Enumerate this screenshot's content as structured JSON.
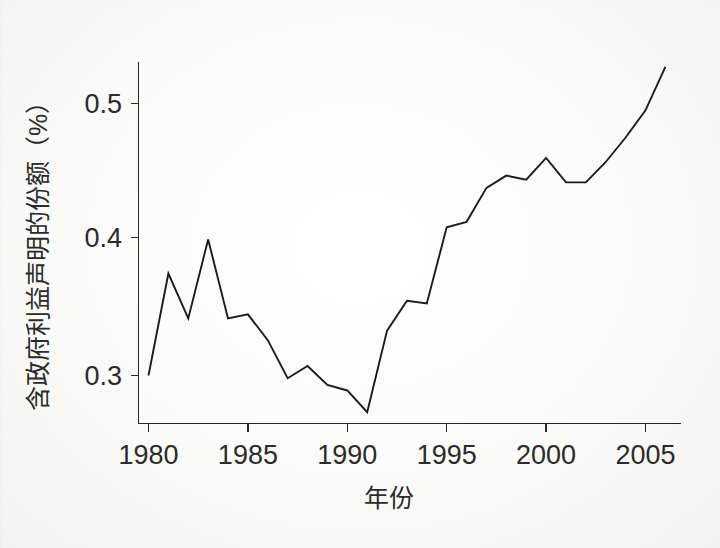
{
  "chart_data": {
    "type": "line",
    "title": "",
    "subtitle": "",
    "xlabel": "年份",
    "ylabel": "含政府利益声明的份额（%）",
    "xlim": [
      1979.2,
      2006.7
    ],
    "ylim": [
      0.263,
      0.537
    ],
    "grid": false,
    "legend": null,
    "x_ticks": [
      1980,
      1985,
      1990,
      1995,
      2000,
      2005
    ],
    "x_tick_labels": [
      "1980",
      "1985",
      "1990",
      "1995",
      "2000",
      "2005"
    ],
    "y_ticks": [
      0.3,
      0.4,
      0.5
    ],
    "y_tick_labels": [
      "0.3",
      "0.4",
      "0.5"
    ],
    "line_color": "#1c1c1c",
    "x": [
      1980,
      1981,
      1982,
      1983,
      1984,
      1985,
      1986,
      1987,
      1988,
      1989,
      1990,
      1991,
      1992,
      1993,
      1994,
      1995,
      1996,
      1997,
      1998,
      1999,
      2000,
      2001,
      2002,
      2003,
      2004,
      2005,
      2006
    ],
    "values": [
      0.3,
      0.375,
      0.342,
      0.4,
      0.342,
      0.345,
      0.326,
      0.298,
      0.307,
      0.293,
      0.289,
      0.273,
      0.333,
      0.355,
      0.353,
      0.409,
      0.413,
      0.438,
      0.447,
      0.444,
      0.46,
      0.442,
      0.442,
      0.457,
      0.475,
      0.495,
      0.527
    ],
    "series": [
      {
        "name": "含政府利益声明的份额",
        "values": [
          0.3,
          0.375,
          0.342,
          0.4,
          0.342,
          0.345,
          0.326,
          0.298,
          0.307,
          0.293,
          0.289,
          0.273,
          0.333,
          0.355,
          0.353,
          0.409,
          0.413,
          0.438,
          0.447,
          0.444,
          0.46,
          0.442,
          0.442,
          0.457,
          0.475,
          0.495,
          0.527
        ]
      }
    ],
    "annotations": []
  },
  "axes": {
    "x_axis_title": "年份",
    "y_axis_title": "含政府利益声明的份额（%）"
  }
}
